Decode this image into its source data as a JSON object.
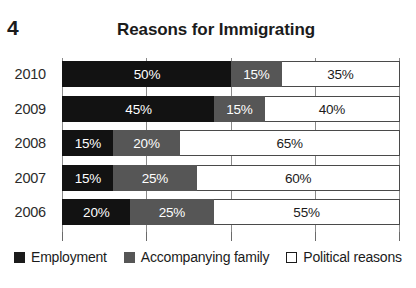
{
  "figure_number": "4",
  "title": "Reasons for Immigrating",
  "legend": {
    "items": [
      {
        "label": "Employment",
        "color": "#1b1b1b",
        "swatch": "filled-square-black-icon"
      },
      {
        "label": "Accompanying family",
        "color": "#565656",
        "swatch": "filled-square-gray-icon"
      },
      {
        "label": "Political reasons",
        "color": "#ffffff",
        "swatch": "outlined-square-white-icon"
      }
    ]
  },
  "rows": [
    {
      "year": "2010",
      "segments": [
        {
          "series": "Employment",
          "value": 50,
          "label": "50%"
        },
        {
          "series": "Accompanying family",
          "value": 15,
          "label": "15%"
        },
        {
          "series": "Political reasons",
          "value": 35,
          "label": "35%"
        }
      ]
    },
    {
      "year": "2009",
      "segments": [
        {
          "series": "Employment",
          "value": 45,
          "label": "45%"
        },
        {
          "series": "Accompanying family",
          "value": 15,
          "label": "15%"
        },
        {
          "series": "Political reasons",
          "value": 40,
          "label": "40%"
        }
      ]
    },
    {
      "year": "2008",
      "segments": [
        {
          "series": "Employment",
          "value": 15,
          "label": "15%"
        },
        {
          "series": "Accompanying family",
          "value": 20,
          "label": "20%"
        },
        {
          "series": "Political reasons",
          "value": 65,
          "label": "65%"
        }
      ]
    },
    {
      "year": "2007",
      "segments": [
        {
          "series": "Employment",
          "value": 15,
          "label": "15%"
        },
        {
          "series": "Accompanying family",
          "value": 25,
          "label": "25%"
        },
        {
          "series": "Political reasons",
          "value": 60,
          "label": "60%"
        }
      ]
    },
    {
      "year": "2006",
      "segments": [
        {
          "series": "Employment",
          "value": 20,
          "label": "20%"
        },
        {
          "series": "Accompanying family",
          "value": 25,
          "label": "25%"
        },
        {
          "series": "Political reasons",
          "value": 55,
          "label": "55%"
        }
      ]
    }
  ],
  "axis": {
    "gridline_positions": [
      0,
      25,
      50,
      75,
      100
    ],
    "tick_positions": [
      0,
      25,
      50,
      75,
      100
    ],
    "min": 0,
    "max": 100
  },
  "chart_data": {
    "type": "bar",
    "orientation": "horizontal",
    "stacked": true,
    "title": "Reasons for Immigrating",
    "xlabel": "",
    "ylabel": "",
    "categories": [
      "2010",
      "2009",
      "2008",
      "2007",
      "2006"
    ],
    "series": [
      {
        "name": "Employment",
        "color": "#1b1b1b",
        "values": [
          50,
          45,
          15,
          15,
          20
        ]
      },
      {
        "name": "Accompanying family",
        "color": "#565656",
        "values": [
          15,
          15,
          20,
          25,
          25
        ]
      },
      {
        "name": "Political reasons",
        "color": "#ffffff",
        "values": [
          35,
          40,
          65,
          60,
          55
        ]
      }
    ],
    "data_labels": [
      [
        "50%",
        "15%",
        "35%"
      ],
      [
        "45%",
        "15%",
        "40%"
      ],
      [
        "15%",
        "20%",
        "65%"
      ],
      [
        "15%",
        "25%",
        "60%"
      ],
      [
        "20%",
        "25%",
        "55%"
      ]
    ],
    "xlim": [
      0,
      100
    ],
    "units": "percent",
    "grid": true,
    "legend_position": "bottom"
  }
}
